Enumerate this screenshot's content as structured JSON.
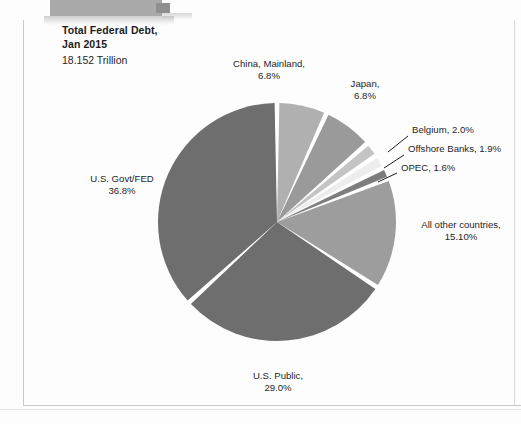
{
  "document": {
    "frame_color": "#c9c9c9",
    "banner_color": "#a9a9a9"
  },
  "title": {
    "line1": "Total Federal Debt,",
    "line2": "Jan 2015",
    "subtitle": "18.152 Trillion"
  },
  "chart_data": {
    "type": "pie",
    "title": "Total Federal Debt, Jan 2015",
    "subtitle": "18.152 Trillion",
    "total_label": "18.152 Trillion",
    "units": "percent of total federal debt",
    "legend": "none (direct labels)",
    "start_angle_deg": 0,
    "direction": "clockwise",
    "slices": [
      {
        "label": "China, Mainland,",
        "value_label": "6.8%",
        "value": 6.8,
        "color": "#b0b0b0"
      },
      {
        "label": "Japan,",
        "value_label": "6.8%",
        "value": 6.8,
        "color": "#9a9a9a"
      },
      {
        "label": "Belgium,",
        "value_label": "2.0%",
        "value": 2.0,
        "color": "#c4c4c4"
      },
      {
        "label": "Offshore Banks,",
        "value_label": "1.9%",
        "value": 1.9,
        "color": "#ededed"
      },
      {
        "label": "OPEC,",
        "value_label": "1.6%",
        "value": 1.6,
        "color": "#7d7d7d"
      },
      {
        "label": "All other countries,",
        "value_label": "15.10%",
        "value": 15.1,
        "color": "#9d9d9d"
      },
      {
        "label": "U.S. Public,",
        "value_label": "29.0%",
        "value": 29.0,
        "color": "#6e6e6e"
      },
      {
        "label": "U.S. Govt/FED",
        "value_label": "36.8%",
        "value": 36.8,
        "color": "#6e6e6e"
      }
    ],
    "categories": [
      "China, Mainland",
      "Japan",
      "Belgium",
      "Offshore Banks",
      "OPEC",
      "All other countries",
      "U.S. Public",
      "U.S. Govt/FED"
    ],
    "values": [
      6.8,
      6.8,
      2.0,
      1.9,
      1.6,
      15.1,
      29.0,
      36.8
    ]
  },
  "labels": {
    "china": {
      "name": "China, Mainland,",
      "value": "6.8%"
    },
    "japan": {
      "name": "Japan,",
      "value": "6.8%"
    },
    "belgium": {
      "name": "Belgium, 2.0%"
    },
    "offshore": {
      "name": "Offshore Banks, 1.9%"
    },
    "opec": {
      "name": "OPEC, 1.6%"
    },
    "others": {
      "name": "All other countries,",
      "value": "15.10%"
    },
    "public": {
      "name": "U.S. Public,",
      "value": "29.0%"
    },
    "govt": {
      "name": "U.S. Govt/FED",
      "value": "36.8%"
    }
  }
}
